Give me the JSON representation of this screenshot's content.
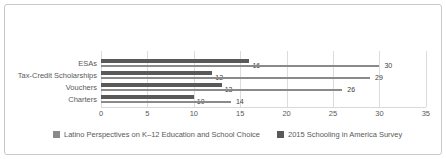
{
  "card": {
    "background": "#ffffff",
    "border_color": "#c9c9c9"
  },
  "chart_data": {
    "type": "bar",
    "orientation": "horizontal",
    "title": "",
    "xlabel": "",
    "ylabel": "",
    "categories": [
      "ESAs",
      "Tax-Credit Scholarships",
      "Vouchers",
      "Charters"
    ],
    "series": [
      {
        "name": "Latino Perspectives on K–12 Education and School Choice",
        "values": [
          30,
          29,
          26,
          14
        ],
        "color": "#8a8a8a"
      },
      {
        "name": "2015 Schooling in America Survey",
        "values": [
          16,
          12,
          13,
          10
        ],
        "color": "#595959"
      }
    ],
    "data_labels": [
      {
        "category": "ESAs",
        "latino_perspectives": 30,
        "schooling_in_america_2015": 16
      },
      {
        "category": "Tax-Credit Scholarships",
        "latino_perspectives": 29,
        "schooling_in_america_2015": 12
      },
      {
        "category": "Vouchers",
        "latino_perspectives": 26,
        "schooling_in_america_2015": 13
      },
      {
        "category": "Charters",
        "latino_perspectives": 14,
        "schooling_in_america_2015": 10
      }
    ],
    "x_ticks": [
      0,
      5,
      10,
      15,
      20,
      25,
      30,
      35
    ],
    "xlim": [
      0,
      35
    ],
    "grid": true,
    "gridline_color": "#dcdcdc",
    "legend_position": "bottom"
  }
}
